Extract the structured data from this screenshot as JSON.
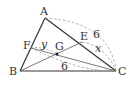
{
  "diagram": {
    "points": {
      "A": {
        "label": "A",
        "x": 45,
        "y": 18
      },
      "B": {
        "label": "B",
        "x": 20,
        "y": 71
      },
      "C": {
        "label": "C",
        "x": 116,
        "y": 71
      },
      "E": {
        "label": "E",
        "x": 82,
        "y": 42
      },
      "F": {
        "label": "F",
        "x": 31,
        "y": 48
      },
      "G": {
        "label": "G",
        "x": 57,
        "y": 54
      }
    },
    "measures": {
      "AC_arc": "6",
      "EC_arc": "x",
      "FC_arc": "6",
      "FG_arc": "y"
    },
    "colors": {
      "line": "#333333",
      "dashed": "#999999",
      "text": "#333333"
    }
  }
}
